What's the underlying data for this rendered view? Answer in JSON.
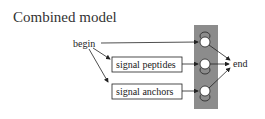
{
  "title": "Combined model",
  "nodes": {
    "begin": "begin",
    "end": "end",
    "signal_peptides": "signal peptides",
    "signal_anchors": "signal anchors"
  },
  "colors": {
    "states_panel": "#8c8c8c",
    "line": "#222222"
  }
}
